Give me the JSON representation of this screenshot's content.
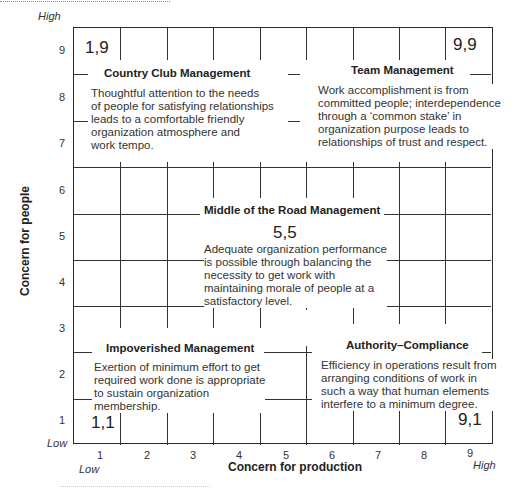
{
  "diagram": {
    "type": "managerial-grid",
    "y_axis": {
      "title": "Concern for people",
      "ticks": [
        "1",
        "2",
        "3",
        "4",
        "5",
        "6",
        "7",
        "8",
        "9"
      ],
      "low_label": "Low",
      "high_label": "High"
    },
    "x_axis": {
      "title": "Concern for production",
      "ticks": [
        "1",
        "2",
        "3",
        "4",
        "5",
        "6",
        "7",
        "8",
        "9"
      ],
      "low_label": "Low",
      "high_label": "High"
    },
    "corners": {
      "top_left": "1,9",
      "top_right": "9,9",
      "center": "5,5",
      "bottom_left": "1,1",
      "bottom_right": "9,1"
    },
    "styles": [
      {
        "title": "Country Club Management",
        "text": "Thoughtful attention to the needs\nof people for satisfying relationships\nleads to a comfortable friendly\norganization atmosphere and\nwork tempo."
      },
      {
        "title": "Team Management",
        "text": "Work accomplishment is from\ncommitted people; interdependence\nthrough a ‘common stake’ in\norganization purpose leads to\nrelationships of trust and respect."
      },
      {
        "title": "Middle of the Road Management",
        "text": "Adequate organization performance\nis possible through balancing the\nnecessity to get work with\nmaintaining morale of people at a\nsatisfactory level."
      },
      {
        "title": "Impoverished Management",
        "text": "Exertion of minimum effort to get\nrequired work done is appropriate\nto sustain organization\nmembership."
      },
      {
        "title": "Authority–Compliance",
        "text": "Efficiency in operations result from\narranging conditions of work in\nsuch a way that human elements\ninterfere to a minimum degree."
      }
    ]
  }
}
